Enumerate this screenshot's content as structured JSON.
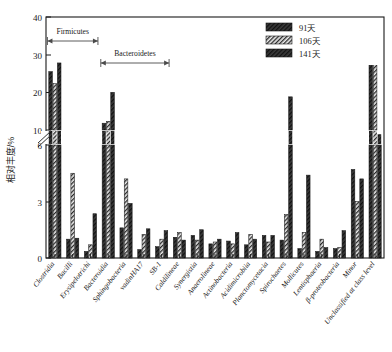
{
  "chart_data": {
    "type": "bar",
    "title": "",
    "xlabel": "",
    "ylabel": "相对丰度/%",
    "ylim": [
      0,
      40
    ],
    "broken_axis": {
      "lower_range": [
        0,
        6
      ],
      "upper_range": [
        10,
        40
      ],
      "break_marker": "double-slash"
    },
    "y_ticks_lower": [
      "0",
      "3",
      "6"
    ],
    "y_ticks_upper": [
      "10",
      "20",
      "30",
      "40"
    ],
    "grid": false,
    "legend_position": "top-right",
    "categories": [
      "Clostridia",
      "Bacilli",
      "Erysipelotrichi",
      "Bacteroidia",
      "Sphingobacteria",
      "vadinHA17",
      "SB-1",
      "Caldilineae",
      "Synergistia",
      "Anaerolineae",
      "Actinobacteria",
      "Acidimicrobiia",
      "Planctomycetacia",
      "Spirochaetes",
      "Mollicutes",
      "Lentisphaeria",
      "β-proteobacteria",
      "Minor",
      "Unclassified at class level"
    ],
    "series": [
      {
        "name": "91天",
        "fill": "dark-hatch",
        "values": [
          25.5,
          1.0,
          0.35,
          11.8,
          1.6,
          0.45,
          0.6,
          1.1,
          1.2,
          0.75,
          0.9,
          0.7,
          1.2,
          0.95,
          0.5,
          0.35,
          0.5,
          4.7,
          36.5
        ]
      },
      {
        "name": "106天",
        "fill": "light-hatch",
        "values": [
          22.3,
          4.5,
          0.7,
          12.3,
          4.2,
          1.25,
          1.0,
          1.35,
          0.95,
          0.85,
          0.75,
          1.25,
          0.85,
          2.3,
          1.35,
          1.0,
          0.55,
          3.0,
          33.3
        ]
      },
      {
        "name": "141天",
        "fill": "dark-hatch",
        "values": [
          27.8,
          1.05,
          2.35,
          20.0,
          2.9,
          1.55,
          1.45,
          0.95,
          1.5,
          1.0,
          1.35,
          1.0,
          1.2,
          18.8,
          4.4,
          0.55,
          1.45,
          4.2,
          9.0
        ]
      }
    ],
    "annotations": [
      {
        "label": "Firmicutes",
        "from_category": "Clostridia",
        "to_category": "Erysipelotrichi",
        "style": "double-arrow-bracket"
      },
      {
        "label": "Bacteroidetes",
        "from_category": "Bacteroidia",
        "to_category": "SB-1",
        "style": "double-arrow-bracket"
      }
    ],
    "note": "Values for bars exceeding 6 are drawn across the axis break; bar 19 (Unclassified) series 141天 rises from the lower panel through the break to 36.5 region."
  },
  "legend": {
    "items": [
      {
        "label": "91天"
      },
      {
        "label": "106天"
      },
      {
        "label": "141天"
      }
    ]
  },
  "axis": {
    "y_label": "相对丰度/%"
  }
}
